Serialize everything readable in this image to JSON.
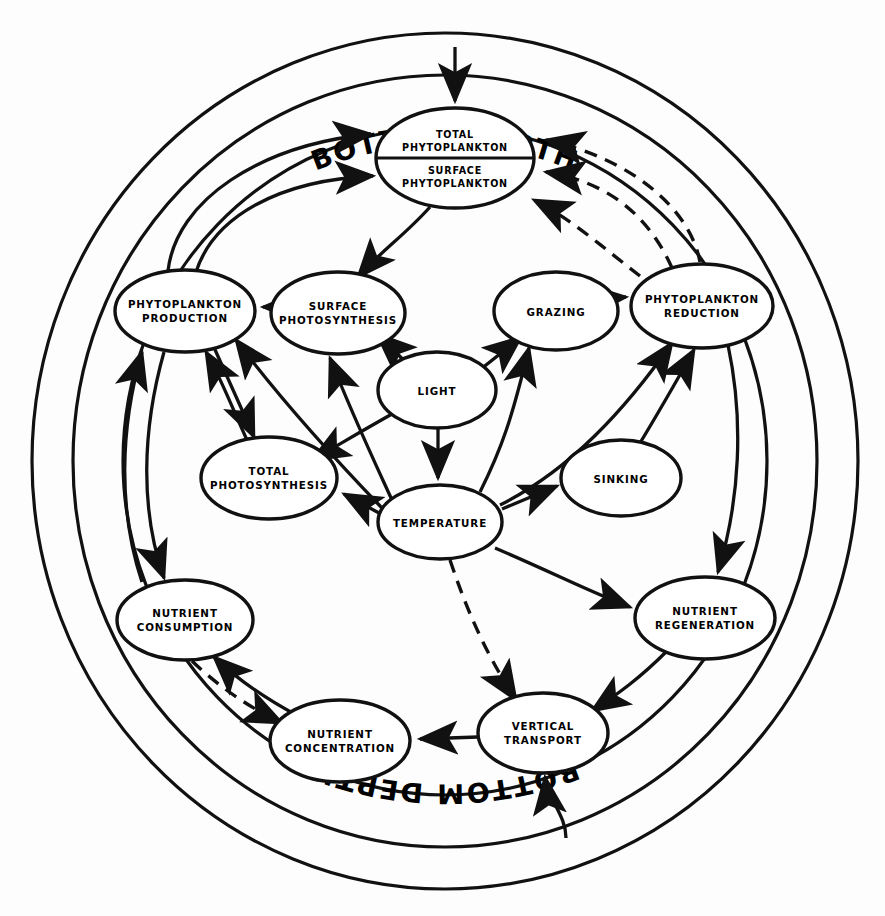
{
  "diagram": {
    "type": "causal-loop-network",
    "style": {
      "background": "#ffffff",
      "stroke": "#111111",
      "node_fill": "#ffffff"
    },
    "boundary": {
      "rings": 3,
      "top_label": "BOTTOM  DEPTH",
      "bottom_label": "BOTTOM  DEPTH"
    },
    "nodes": [
      {
        "id": "total_phytoplankton",
        "label_line1": "TOTAL",
        "label_line2": "PHYTOPLANKTON",
        "cx": 455,
        "cy": 133,
        "rx": 79,
        "ry": 25,
        "split": true
      },
      {
        "id": "surface_phytoplankton",
        "label_line1": "SURFACE",
        "label_line2": "PHYTOPLANKTON",
        "cx": 455,
        "cy": 183,
        "rx": 79,
        "ry": 25,
        "split": true
      },
      {
        "id": "phytoplankton_production",
        "label_line1": "PHYTOPLANKTON",
        "label_line2": "PRODUCTION",
        "cx": 185,
        "cy": 311,
        "rx": 70,
        "ry": 41,
        "split": false
      },
      {
        "id": "surface_photosynthesis",
        "label_line1": "SURFACE",
        "label_line2": "PHOTOSYNTHESIS",
        "cx": 338,
        "cy": 313,
        "rx": 67,
        "ry": 41,
        "split": false
      },
      {
        "id": "grazing",
        "label_line1": "GRAZING",
        "label_line2": "",
        "cx": 556,
        "cy": 311,
        "rx": 62,
        "ry": 39,
        "split": false
      },
      {
        "id": "phytoplankton_reduction",
        "label_line1": "PHYTOPLANKTON",
        "label_line2": "REDUCTION",
        "cx": 702,
        "cy": 306,
        "rx": 71,
        "ry": 42,
        "split": false
      },
      {
        "id": "light",
        "label_line1": "LIGHT",
        "label_line2": "",
        "cx": 437,
        "cy": 390,
        "rx": 59,
        "ry": 38,
        "split": false
      },
      {
        "id": "total_photosynthesis",
        "label_line1": "TOTAL",
        "label_line2": "PHOTOSYNTHESIS",
        "cx": 269,
        "cy": 478,
        "rx": 68,
        "ry": 41,
        "split": false
      },
      {
        "id": "sinking",
        "label_line1": "SINKING",
        "label_line2": "",
        "cx": 621,
        "cy": 478,
        "rx": 60,
        "ry": 38,
        "split": false
      },
      {
        "id": "temperature",
        "label_line1": "TEMPERATURE",
        "label_line2": "",
        "cx": 440,
        "cy": 522,
        "rx": 62,
        "ry": 37,
        "split": false
      },
      {
        "id": "nutrient_consumption",
        "label_line1": "NUTRIENT",
        "label_line2": "CONSUMPTION",
        "cx": 185,
        "cy": 620,
        "rx": 68,
        "ry": 40,
        "split": false
      },
      {
        "id": "nutrient_regeneration",
        "label_line1": "NUTRIENT",
        "label_line2": "REGENERATION",
        "cx": 705,
        "cy": 618,
        "rx": 70,
        "ry": 41,
        "split": false
      },
      {
        "id": "nutrient_concentration",
        "label_line1": "NUTRIENT",
        "label_line2": "CONCENTRATION",
        "cx": 340,
        "cy": 741,
        "rx": 70,
        "ry": 41,
        "split": false
      },
      {
        "id": "vertical_transport",
        "label_line1": "VERTICAL",
        "label_line2": "TRANSPORT",
        "cx": 543,
        "cy": 733,
        "rx": 65,
        "ry": 40,
        "split": false
      }
    ],
    "edges": [
      {
        "from": "bottom_depth_top",
        "to": "total_phytoplankton",
        "style": "solid"
      },
      {
        "from": "bottom_depth_bottom",
        "to": "vertical_transport",
        "style": "solid"
      },
      {
        "from": "phytoplankton_production",
        "to": "total_phytoplankton",
        "style": "solid"
      },
      {
        "from": "phytoplankton_production",
        "to": "surface_phytoplankton",
        "style": "solid"
      },
      {
        "from": "surface_photosynthesis",
        "to": "phytoplankton_production",
        "style": "solid"
      },
      {
        "from": "total_photosynthesis",
        "to": "phytoplankton_production",
        "style": "solid"
      },
      {
        "from": "phytoplankton_production",
        "to": "total_photosynthesis",
        "style": "solid"
      },
      {
        "from": "surface_phytoplankton",
        "to": "surface_photosynthesis",
        "style": "solid"
      },
      {
        "from": "light",
        "to": "surface_photosynthesis",
        "style": "dashed"
      },
      {
        "from": "light",
        "to": "grazing",
        "style": "solid"
      },
      {
        "from": "light",
        "to": "temperature",
        "style": "solid"
      },
      {
        "from": "light",
        "to": "total_photosynthesis",
        "style": "solid"
      },
      {
        "from": "temperature",
        "to": "surface_photosynthesis",
        "style": "solid"
      },
      {
        "from": "temperature",
        "to": "total_photosynthesis",
        "style": "solid"
      },
      {
        "from": "temperature",
        "to": "grazing",
        "style": "solid"
      },
      {
        "from": "temperature",
        "to": "sinking",
        "style": "solid"
      },
      {
        "from": "temperature",
        "to": "phytoplankton_reduction",
        "style": "solid"
      },
      {
        "from": "temperature",
        "to": "nutrient_regeneration",
        "style": "solid"
      },
      {
        "from": "temperature",
        "to": "vertical_transport",
        "style": "dashed"
      },
      {
        "from": "temperature",
        "to": "phytoplankton_production",
        "style": "solid"
      },
      {
        "from": "grazing",
        "to": "phytoplankton_reduction",
        "style": "solid"
      },
      {
        "from": "sinking",
        "to": "phytoplankton_reduction",
        "style": "solid"
      },
      {
        "from": "phytoplankton_reduction",
        "to": "total_phytoplankton",
        "style": "dashed"
      },
      {
        "from": "phytoplankton_reduction",
        "to": "surface_phytoplankton",
        "style": "dashed"
      },
      {
        "from": "phytoplankton_reduction",
        "to": "nutrient_regeneration",
        "style": "solid"
      },
      {
        "from": "nutrient_regeneration",
        "to": "vertical_transport",
        "style": "solid"
      },
      {
        "from": "vertical_transport",
        "to": "nutrient_concentration",
        "style": "solid"
      },
      {
        "from": "nutrient_concentration",
        "to": "nutrient_consumption",
        "style": "solid"
      },
      {
        "from": "nutrient_consumption",
        "to": "nutrient_concentration",
        "style": "dashed"
      },
      {
        "from": "phytoplankton_production",
        "to": "nutrient_consumption",
        "style": "solid"
      },
      {
        "from": "nutrient_consumption",
        "to": "phytoplankton_production",
        "style": "solid"
      }
    ]
  }
}
